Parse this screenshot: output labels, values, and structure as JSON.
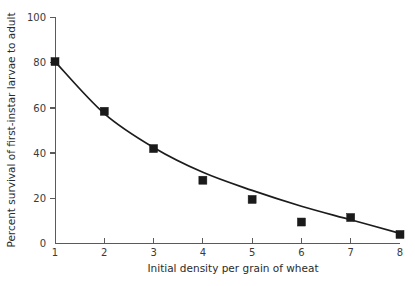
{
  "chart_data": {
    "type": "scatter",
    "title": "",
    "xlabel": "Initial density per grain of wheat",
    "ylabel": "Percent survival of first-instar larvae to adult",
    "x": [
      1,
      2,
      3,
      4,
      5,
      6,
      7,
      8
    ],
    "values": [
      80.5,
      58.5,
      42,
      28,
      19.5,
      9.5,
      11.5,
      4
    ],
    "series": [
      {
        "name": "Percent survival",
        "x": [
          1,
          2,
          3,
          4,
          5,
          6,
          7,
          8
        ],
        "values": [
          80.5,
          58.5,
          42,
          28,
          19.5,
          9.5,
          11.5,
          4
        ],
        "marker": "filled-square",
        "color": "#1a1a1a"
      },
      {
        "name": "Fitted decay curve",
        "x": [
          1,
          2,
          3,
          4,
          5,
          6,
          7,
          8
        ],
        "values": [
          80.5,
          57.5,
          42.5,
          31.5,
          23.5,
          16.5,
          10.5,
          4.5
        ],
        "marker": "none",
        "color": "#1c1c1c"
      }
    ],
    "xlim": [
      1,
      8
    ],
    "ylim": [
      0,
      100
    ],
    "xticks": [
      "1",
      "2",
      "3",
      "4",
      "5",
      "6",
      "7",
      "8"
    ],
    "yticks": [
      "0",
      "20",
      "40",
      "60",
      "80",
      "100"
    ],
    "grid": false,
    "legend": "none"
  },
  "axes": {
    "y_tick_labels": [
      "100",
      "80",
      "60",
      "40",
      "20",
      "0"
    ],
    "x_tick_labels": [
      "1",
      "2",
      "3",
      "4",
      "5",
      "6",
      "7",
      "8"
    ],
    "y_title": "Percent survival of first-instar larvae to adult",
    "x_title": "Initial density per grain of wheat"
  },
  "colors": {
    "background": "#ffffff",
    "axis": "#5a5a5a",
    "marker": "#1a1a1a",
    "curve": "#1c1c1c",
    "text": "#2b2b2b"
  }
}
